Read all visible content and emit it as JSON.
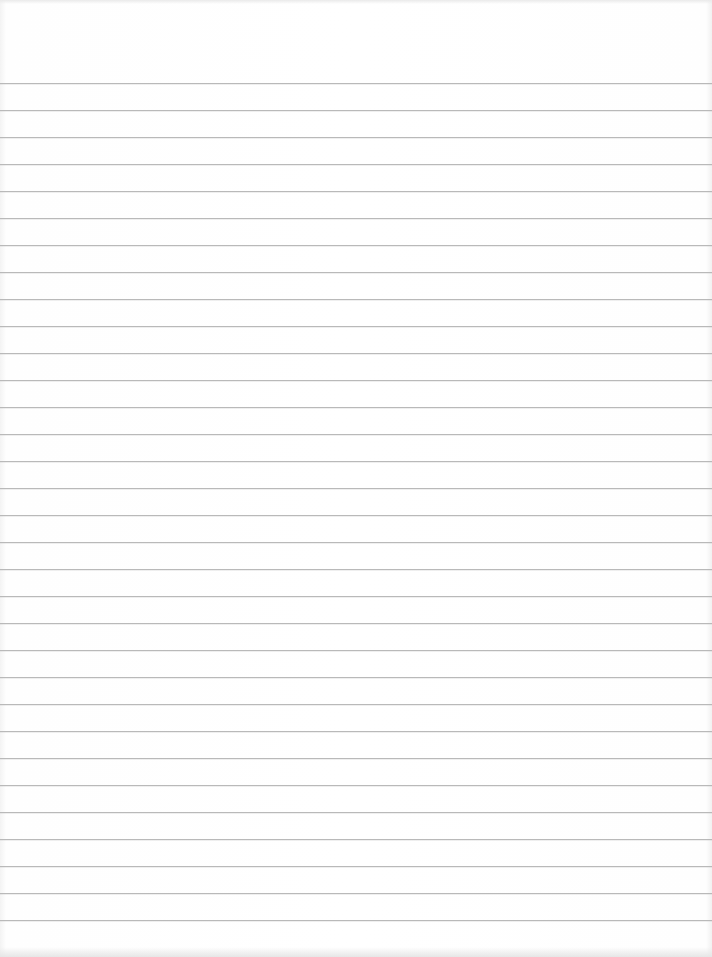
{
  "paper": {
    "type": "ruled-lined-paper",
    "background_color": "#ffffff",
    "line_color": "#b9b9b9",
    "first_line_y": 83,
    "line_spacing": 27,
    "line_count": 32
  }
}
